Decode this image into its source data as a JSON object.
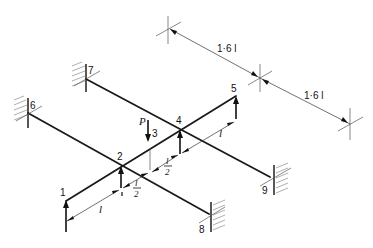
{
  "diagram": {
    "nodes": [
      {
        "id": "1",
        "label": "1"
      },
      {
        "id": "2",
        "label": "2"
      },
      {
        "id": "3",
        "label": "3"
      },
      {
        "id": "4",
        "label": "4"
      },
      {
        "id": "5",
        "label": "5"
      },
      {
        "id": "6",
        "label": "6"
      },
      {
        "id": "7",
        "label": "7"
      },
      {
        "id": "8",
        "label": "8"
      },
      {
        "id": "9",
        "label": "9"
      }
    ],
    "load": {
      "label": "P"
    },
    "dimensions": {
      "top_span_1": "1·6 l",
      "top_span_2": "1·6 l",
      "seg_1_2": "l",
      "seg_2_3_num": "l",
      "seg_2_3_den": "2",
      "seg_3_4_num": "l",
      "seg_3_4_den": "2",
      "seg_4_5": "l"
    },
    "colors": {
      "line": "#1a1a1a",
      "hatch": "#777777",
      "background": "#ffffff"
    }
  }
}
